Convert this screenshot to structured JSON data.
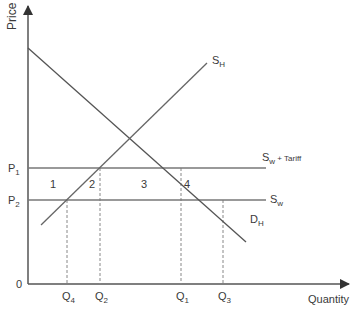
{
  "diagram": {
    "axes": {
      "y_label": "Price",
      "x_label": "Quantity",
      "origin_label": "0"
    },
    "price_levels": [
      {
        "id": "P1",
        "main": "P",
        "sub": "1"
      },
      {
        "id": "P2",
        "main": "P",
        "sub": "2"
      }
    ],
    "quantity_levels": [
      {
        "id": "Q4",
        "main": "Q",
        "sub": "4"
      },
      {
        "id": "Q2",
        "main": "Q",
        "sub": "2"
      },
      {
        "id": "Q1",
        "main": "Q",
        "sub": "1"
      },
      {
        "id": "Q3",
        "main": "Q",
        "sub": "3"
      }
    ],
    "curves": {
      "home_supply": {
        "main": "S",
        "sub": "H"
      },
      "home_demand": {
        "main": "D",
        "sub": "H"
      },
      "world_supply": {
        "main": "S",
        "sub": "w"
      },
      "world_supply_tariff": {
        "main": "S",
        "sub": "w",
        "suffix": " + Tariff"
      }
    },
    "areas": [
      "1",
      "2",
      "3",
      "4"
    ],
    "colors": {
      "axis": "#444444",
      "line": "#555555",
      "dashed": "#888888",
      "text": "#3a3a3a"
    }
  }
}
